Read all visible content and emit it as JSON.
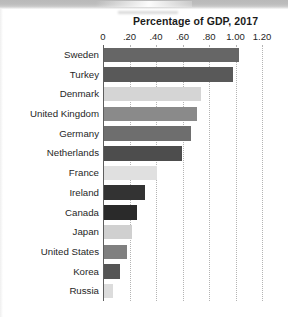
{
  "chart_data": {
    "type": "bar",
    "orientation": "horizontal",
    "title": "Percentage of GDP, 2017",
    "xlabel": "",
    "ylabel": "",
    "xlim": [
      0,
      1.2
    ],
    "grid": true,
    "legend": "none",
    "xticks": [
      {
        "value": 0,
        "label": "0"
      },
      {
        "value": 0.2,
        "label": ".20"
      },
      {
        "value": 0.4,
        "label": ".40"
      },
      {
        "value": 0.6,
        "label": ".60"
      },
      {
        "value": 0.8,
        "label": ".80"
      },
      {
        "value": 1.0,
        "label": "1.00"
      },
      {
        "value": 1.2,
        "label": "1.20"
      }
    ],
    "categories": [
      "Sweden",
      "Turkey",
      "Denmark",
      "United Kingdom",
      "Germany",
      "Netherlands",
      "France",
      "Ireland",
      "Canada",
      "Japan",
      "United States",
      "Korea",
      "Russia"
    ],
    "values": [
      1.02,
      0.97,
      0.73,
      0.7,
      0.66,
      0.59,
      0.4,
      0.31,
      0.25,
      0.21,
      0.17,
      0.12,
      0.07
    ],
    "bar_colors": [
      "#666666",
      "#595959",
      "#d5d5d5",
      "#8a8a8a",
      "#6e6e6e",
      "#4d4d4d",
      "#e0e0e0",
      "#333333",
      "#2a2a2a",
      "#d0d0d0",
      "#808080",
      "#555555",
      "#dcdcdc"
    ],
    "axis_color": "#5e5e5e",
    "gridline_color": "#b4b4b4",
    "background": "#ffffff"
  }
}
